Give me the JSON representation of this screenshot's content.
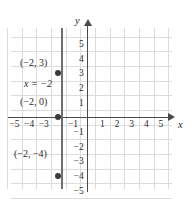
{
  "figure": {
    "axis_names": {
      "x": "x",
      "y": "y"
    },
    "colors": {
      "grid": "#dcdcdc",
      "axis": "#4a4a4a",
      "line": "#6f6f6f",
      "point": "#3a3a3a",
      "background": "#ffffff"
    }
  },
  "chart_data": {
    "type": "line",
    "title": "",
    "xlabel": "x",
    "ylabel": "y",
    "xlim": [
      -5.5,
      5.5
    ],
    "ylim": [
      -5.5,
      5.5
    ],
    "grid": true,
    "legend": "none",
    "equation": "x = -2",
    "series": [
      {
        "name": "x = -2",
        "kind": "vertical-line",
        "x": -2,
        "y_range": [
          -5.5,
          5.5
        ]
      }
    ],
    "points": [
      {
        "label": "(-2, 3)",
        "x": -2,
        "y": 3
      },
      {
        "label": "(-2, 0)",
        "x": -2,
        "y": 0
      },
      {
        "label": "(-2, -4)",
        "x": -2,
        "y": -4
      }
    ],
    "annotations": [
      {
        "text": "(−2, 3)",
        "name": "point-label-top",
        "italic": false
      },
      {
        "text": "x = −2",
        "name": "equation-label",
        "italic": true
      },
      {
        "text": "(−2, 0)",
        "name": "point-label-middle",
        "italic": false
      },
      {
        "text": "(−2, −4)",
        "name": "point-label-bottom",
        "italic": false
      }
    ],
    "x_ticks": [
      {
        "value": -5,
        "label": "−5"
      },
      {
        "value": -4,
        "label": "−4"
      },
      {
        "value": -3,
        "label": "−3"
      },
      {
        "value": -1,
        "label": "−1"
      },
      {
        "value": 1,
        "label": "1"
      },
      {
        "value": 2,
        "label": "2"
      },
      {
        "value": 3,
        "label": "3"
      },
      {
        "value": 4,
        "label": "4"
      },
      {
        "value": 5,
        "label": "5"
      }
    ],
    "y_ticks": [
      {
        "value": 5,
        "label": "5"
      },
      {
        "value": 4,
        "label": "4"
      },
      {
        "value": 3,
        "label": "3"
      },
      {
        "value": 2,
        "label": "2"
      },
      {
        "value": 1,
        "label": "1"
      },
      {
        "value": -1,
        "label": "−1"
      },
      {
        "value": -2,
        "label": "−2"
      },
      {
        "value": -3,
        "label": "−3"
      },
      {
        "value": -4,
        "label": "−4"
      },
      {
        "value": -5,
        "label": "−5"
      }
    ]
  }
}
